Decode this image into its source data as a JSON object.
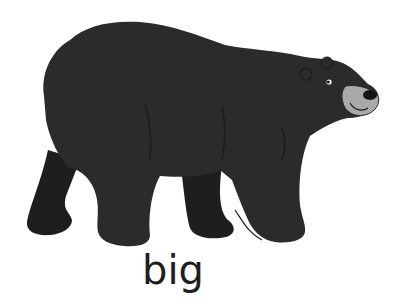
{
  "image": {
    "subject": "black bear walking",
    "caption": "big"
  },
  "colors": {
    "background": "#ffffff",
    "fur": "#2a2a2a",
    "fur_shadow": "#1c1c1c",
    "muzzle": "#a8a8a8",
    "nose": "#151515",
    "text": "#1e1e1e"
  }
}
